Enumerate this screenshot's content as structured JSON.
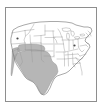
{
  "figure": {
    "kind": "map-figure",
    "title": "",
    "caption": "",
    "frame": {
      "visible": true,
      "color": "#8e8e8e",
      "x": 5,
      "y": 7,
      "width": 92,
      "height": 95
    },
    "background_color": "#ffffff"
  },
  "map": {
    "name": "contiguous-united-states",
    "projection": "albers",
    "state_outline_color": "#9a9a9a",
    "national_outline_color": "#6f6f6f",
    "land_fill_color": "#ffffff",
    "water_fill_color": "#ffffff"
  },
  "highlight": {
    "label": "",
    "fill_color": "#a9a9a9",
    "outline_color": "#8a8a8a",
    "opacity": 0.85,
    "states": [
      "California",
      "Nevada",
      "Utah",
      "Arizona",
      "New Mexico",
      "Colorado",
      "Texas",
      "Oklahoma"
    ]
  },
  "markers": [
    {
      "name": "marker-northwest",
      "x": 17.5,
      "y": 38.5,
      "color": "#4a4a4a"
    },
    {
      "name": "marker-great-lakes",
      "x": 74.5,
      "y": 45.5,
      "color": "#4a4a4a"
    }
  ],
  "legend": {
    "visible": false,
    "entries": []
  },
  "axes": {
    "visible": false,
    "x_ticks": [],
    "y_ticks": []
  }
}
